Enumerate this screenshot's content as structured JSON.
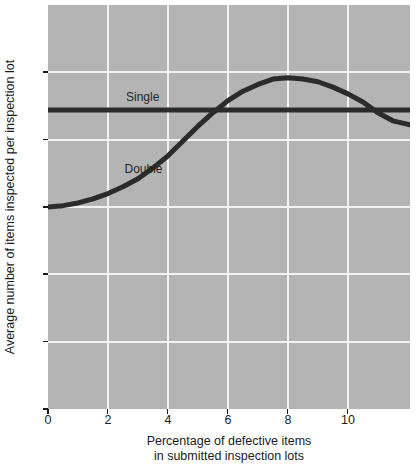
{
  "chart_data": {
    "type": "line",
    "title": "",
    "xlabel": "Percentage of defective items in submitted inspection lots",
    "xlabel_line1": "Percentage of defective items",
    "xlabel_line2": "in submitted inspection lots",
    "ylabel": "Average number of items inspected per inspection lot",
    "xlim": [
      0,
      12.07
    ],
    "ylim": [
      0,
      300
    ],
    "xticks": [
      0,
      2,
      4,
      6,
      8,
      10
    ],
    "xtick_labels": [
      "0",
      "2",
      "4",
      "6",
      "8",
      "10"
    ],
    "yticks": [
      0,
      50,
      100,
      150,
      200,
      250
    ],
    "ytick_labels": [
      "0",
      "50",
      "100",
      "150",
      "200",
      "250"
    ],
    "grid": true,
    "grid_color": "#f2f2f2",
    "plot_bg": "#b4b4b4",
    "line_color": "#2b2b2b",
    "legend_position": "inline-annotations",
    "series": [
      {
        "name": "Single",
        "label_text": "Single",
        "type": "horizontal-line",
        "constant_value": 222,
        "points": [
          {
            "x": 0,
            "y": 222
          },
          {
            "x": 12.07,
            "y": 222
          }
        ]
      },
      {
        "name": "Double",
        "label_text": "Double",
        "type": "curve",
        "points": [
          {
            "x": 0.0,
            "y": 150
          },
          {
            "x": 0.5,
            "y": 151
          },
          {
            "x": 1.0,
            "y": 153
          },
          {
            "x": 1.5,
            "y": 156
          },
          {
            "x": 2.0,
            "y": 160
          },
          {
            "x": 2.5,
            "y": 165
          },
          {
            "x": 3.0,
            "y": 171
          },
          {
            "x": 3.5,
            "y": 179
          },
          {
            "x": 4.0,
            "y": 188
          },
          {
            "x": 4.5,
            "y": 199
          },
          {
            "x": 5.0,
            "y": 210
          },
          {
            "x": 5.5,
            "y": 220
          },
          {
            "x": 6.0,
            "y": 229
          },
          {
            "x": 6.5,
            "y": 236
          },
          {
            "x": 7.0,
            "y": 241
          },
          {
            "x": 7.5,
            "y": 245
          },
          {
            "x": 8.0,
            "y": 246
          },
          {
            "x": 8.5,
            "y": 245
          },
          {
            "x": 9.0,
            "y": 243
          },
          {
            "x": 9.5,
            "y": 239
          },
          {
            "x": 10.0,
            "y": 234
          },
          {
            "x": 10.5,
            "y": 228
          },
          {
            "x": 11.0,
            "y": 220
          },
          {
            "x": 11.5,
            "y": 214
          },
          {
            "x": 12.07,
            "y": 211
          }
        ]
      }
    ],
    "annotations": [
      {
        "text": "Single",
        "x": 2.6,
        "y": 232
      },
      {
        "text": "Double",
        "x": 2.55,
        "y": 178
      }
    ]
  }
}
